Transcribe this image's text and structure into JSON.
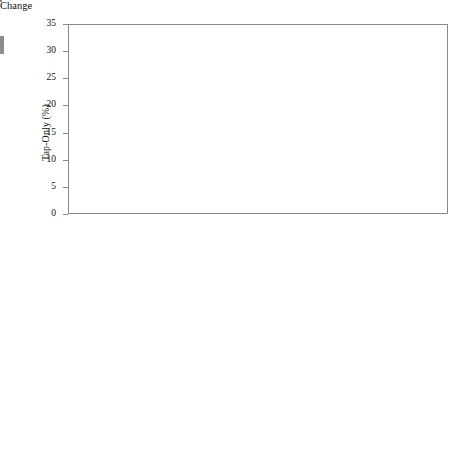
{
  "figure": {
    "width": 473,
    "height": 475,
    "background": "#ffffff",
    "bar_fill": "#969696",
    "bar_edge": "#5d5d5d",
    "axis_color": "#8a8a8a"
  },
  "axis": {
    "x_title": "Change",
    "x_ticks": [
      "0.9",
      "1.2",
      "1.5",
      "1.8",
      "2.1",
      "2.4",
      "2.7",
      "3.0",
      "3.3",
      "3.6",
      "3.9",
      "4.2",
      "4.5",
      "4.8"
    ],
    "y_ticks": [
      "0",
      "5",
      "10",
      "15",
      "20",
      "25",
      "30",
      "35"
    ]
  },
  "panels": [
    {
      "id": "tap-only",
      "y_title": "Tap-Only (%)"
    },
    {
      "id": "bottle-only",
      "y_title": "Bottle-Only (%)"
    }
  ],
  "chart_data": [
    {
      "type": "bar",
      "title": "",
      "panel": "tap-only",
      "xlabel": "Change",
      "ylabel": "Tap-Only (%)",
      "xlim": [
        0.75,
        4.95
      ],
      "ylim": [
        0,
        35
      ],
      "ytick_values": [
        0,
        5,
        10,
        15,
        20,
        25,
        30,
        35
      ],
      "xtick_values": [
        0.9,
        1.2,
        1.5,
        1.8,
        2.1,
        2.4,
        2.7,
        3.0,
        3.3,
        3.6,
        3.9,
        4.2,
        4.5,
        4.8
      ],
      "grid": false,
      "legend": null,
      "bin_width": 0.3,
      "bin_centers": [
        0.9,
        1.2,
        1.5,
        1.8,
        2.1,
        2.4,
        2.7,
        3.0,
        3.3,
        3.6,
        3.9,
        4.2,
        4.5,
        4.8
      ],
      "categories": [
        "0.9",
        "1.2",
        "1.5",
        "1.8",
        "2.1",
        "2.4",
        "2.7",
        "3.0",
        "3.3",
        "3.6",
        "3.9",
        "4.2",
        "4.5",
        "4.8"
      ],
      "values": [
        1.0,
        2.6,
        3.2,
        12.6,
        21.0,
        15.2,
        16.6,
        18.0,
        6.2,
        2.9,
        0,
        0,
        0,
        0
      ]
    },
    {
      "type": "bar",
      "title": "",
      "panel": "bottle-only",
      "xlabel": "Change",
      "ylabel": "Bottle-Only (%)",
      "xlim": [
        0.75,
        4.95
      ],
      "ylim": [
        0,
        35
      ],
      "ytick_values": [
        0,
        5,
        10,
        15,
        20,
        25,
        30,
        35
      ],
      "xtick_values": [
        0.9,
        1.2,
        1.5,
        1.8,
        2.1,
        2.4,
        2.7,
        3.0,
        3.3,
        3.6,
        3.9,
        4.2,
        4.5,
        4.8
      ],
      "grid": false,
      "legend": null,
      "bin_width": 0.3,
      "bin_centers": [
        0.9,
        1.2,
        1.5,
        1.8,
        2.1,
        2.4,
        2.7,
        3.0,
        3.3,
        3.6,
        3.9,
        4.2,
        4.5,
        4.8
      ],
      "categories": [
        "0.9",
        "1.2",
        "1.5",
        "1.8",
        "2.1",
        "2.4",
        "2.7",
        "3.0",
        "3.3",
        "3.6",
        "3.9",
        "4.2",
        "4.5",
        "4.8"
      ],
      "values": [
        0.3,
        3.9,
        10.9,
        20.9,
        27.8,
        23.5,
        9.3,
        2.6,
        0.9,
        0,
        0,
        0,
        0,
        0
      ]
    }
  ]
}
